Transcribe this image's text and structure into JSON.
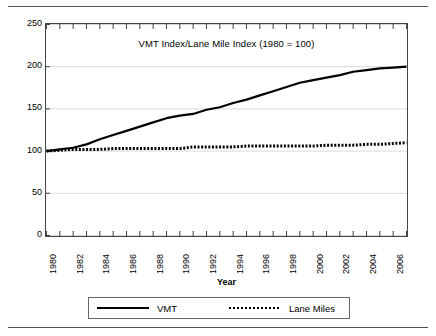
{
  "chart_data": {
    "type": "line",
    "title": "VMT Index/Lane Mile Index (1980 = 100)",
    "xlabel": "Year",
    "ylabel": "",
    "xlim": [
      1980,
      2007
    ],
    "ylim": [
      0,
      250
    ],
    "yticks": [
      0,
      50,
      100,
      150,
      200,
      250
    ],
    "grid": true,
    "grid_axis": "y",
    "legend_position": "bottom",
    "x": [
      1980,
      1981,
      1982,
      1983,
      1984,
      1985,
      1986,
      1987,
      1988,
      1989,
      1990,
      1991,
      1992,
      1993,
      1994,
      1995,
      1996,
      1997,
      1998,
      1999,
      2000,
      2001,
      2002,
      2003,
      2004,
      2005,
      2006,
      2007
    ],
    "xticklabels": [
      "1980",
      "",
      "1982",
      "",
      "1984",
      "",
      "1986",
      "",
      "1988",
      "",
      "1990",
      "",
      "1992",
      "",
      "1994",
      "",
      "1996",
      "",
      "1998",
      "",
      "2000",
      "",
      "2002",
      "",
      "2004",
      "",
      "2006",
      ""
    ],
    "series": [
      {
        "name": "VMT",
        "style": "solid",
        "color": "#000000",
        "values": [
          100,
          102,
          104,
          108,
          114,
          119,
          124,
          129,
          134,
          139,
          142,
          144,
          149,
          152,
          157,
          161,
          166,
          171,
          176,
          181,
          184,
          187,
          190,
          194,
          196,
          198,
          199,
          200
        ]
      },
      {
        "name": "Lane Miles",
        "style": "dotted",
        "color": "#000000",
        "values": [
          100,
          101,
          102,
          102,
          102,
          103,
          103,
          103,
          103,
          103,
          103,
          105,
          105,
          105,
          105,
          106,
          106,
          106,
          106,
          106,
          106,
          107,
          107,
          107,
          108,
          108,
          109,
          110
        ]
      }
    ]
  },
  "legend": {
    "entries": [
      {
        "label": "VMT",
        "style": "solid"
      },
      {
        "label": "Lane Miles",
        "style": "dotted"
      }
    ]
  }
}
